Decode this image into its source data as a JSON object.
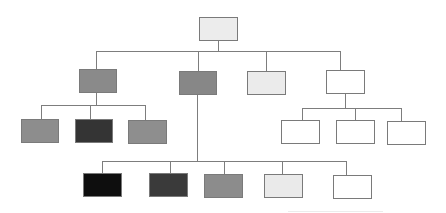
{
  "diagram": {
    "type": "org-chart",
    "title": "",
    "line_color": "#7d7d7d",
    "border_color": "#7a7a7a",
    "nodes": [
      {
        "id": "root",
        "level": 0,
        "fill": "#ececec",
        "x": 199,
        "y": 17,
        "w": 39,
        "h": 24
      },
      {
        "id": "l1-a",
        "level": 1,
        "parent": "root",
        "fill": "#8a8a8a",
        "x": 79,
        "y": 69,
        "w": 38,
        "h": 24
      },
      {
        "id": "l1-b",
        "level": 1,
        "parent": "root",
        "fill": "#878787",
        "x": 179,
        "y": 71,
        "w": 38,
        "h": 24
      },
      {
        "id": "l1-c",
        "level": 1,
        "parent": "root",
        "fill": "#ebebeb",
        "x": 247,
        "y": 71,
        "w": 39,
        "h": 24
      },
      {
        "id": "l1-d",
        "level": 1,
        "parent": "root",
        "fill": "#ffffff",
        "x": 326,
        "y": 70,
        "w": 39,
        "h": 24
      },
      {
        "id": "l2-a1",
        "level": 2,
        "parent": "l1-a",
        "fill": "#8d8d8d",
        "x": 21,
        "y": 119,
        "w": 38,
        "h": 24
      },
      {
        "id": "l2-a2",
        "level": 2,
        "parent": "l1-a",
        "fill": "#343434",
        "x": 75,
        "y": 119,
        "w": 38,
        "h": 24
      },
      {
        "id": "l2-a3",
        "level": 2,
        "parent": "l1-a",
        "fill": "#8e8e8e",
        "x": 128,
        "y": 120,
        "w": 39,
        "h": 24
      },
      {
        "id": "l2-d1",
        "level": 2,
        "parent": "l1-d",
        "fill": "#ffffff",
        "x": 281,
        "y": 120,
        "w": 39,
        "h": 24
      },
      {
        "id": "l2-d2",
        "level": 2,
        "parent": "l1-d",
        "fill": "#ffffff",
        "x": 336,
        "y": 120,
        "w": 39,
        "h": 24
      },
      {
        "id": "l2-d3",
        "level": 2,
        "parent": "l1-d",
        "fill": "#ffffff",
        "x": 387,
        "y": 121,
        "w": 39,
        "h": 24
      },
      {
        "id": "l3-b1",
        "level": 3,
        "parent": "l1-b",
        "fill": "#0e0e0e",
        "x": 83,
        "y": 173,
        "w": 39,
        "h": 24
      },
      {
        "id": "l3-b2",
        "level": 3,
        "parent": "l1-b",
        "fill": "#3a3a3a",
        "x": 149,
        "y": 173,
        "w": 39,
        "h": 24
      },
      {
        "id": "l3-b3",
        "level": 3,
        "parent": "l1-b",
        "fill": "#8c8c8c",
        "x": 204,
        "y": 174,
        "w": 39,
        "h": 24
      },
      {
        "id": "l3-b4",
        "level": 3,
        "parent": "l1-b",
        "fill": "#eaeaea",
        "x": 264,
        "y": 174,
        "w": 39,
        "h": 24
      },
      {
        "id": "l3-b5",
        "level": 3,
        "parent": "l1-b",
        "fill": "#ffffff",
        "x": 333,
        "y": 175,
        "w": 39,
        "h": 24
      }
    ],
    "hlines": [
      {
        "id": "bus-root",
        "x": 96,
        "y": 51,
        "w": 245
      },
      {
        "id": "bus-l1-a",
        "x": 41,
        "y": 105,
        "w": 105
      },
      {
        "id": "bus-l1-d",
        "x": 302,
        "y": 108,
        "w": 100
      },
      {
        "id": "bus-l1-b",
        "x": 102,
        "y": 161,
        "w": 245
      },
      {
        "id": "faint-baseline",
        "x": 288,
        "y": 211,
        "w": 95,
        "faint": true
      }
    ],
    "vlines": [
      {
        "id": "root-down",
        "x": 218,
        "y": 41,
        "h": 10
      },
      {
        "id": "to-l1-a",
        "x": 96,
        "y": 51,
        "h": 18
      },
      {
        "id": "to-l1-b",
        "x": 198,
        "y": 51,
        "h": 20
      },
      {
        "id": "to-l1-c",
        "x": 266,
        "y": 51,
        "h": 20
      },
      {
        "id": "to-l1-d",
        "x": 340,
        "y": 51,
        "h": 19
      },
      {
        "id": "l1-a-down",
        "x": 96,
        "y": 93,
        "h": 12
      },
      {
        "id": "to-l2-a1",
        "x": 41,
        "y": 105,
        "h": 14
      },
      {
        "id": "to-l2-a2",
        "x": 90,
        "y": 105,
        "h": 14
      },
      {
        "id": "to-l2-a3",
        "x": 145,
        "y": 105,
        "h": 15
      },
      {
        "id": "l1-d-down",
        "x": 345,
        "y": 94,
        "h": 14
      },
      {
        "id": "to-l2-d1",
        "x": 302,
        "y": 108,
        "h": 12
      },
      {
        "id": "to-l2-d2",
        "x": 355,
        "y": 108,
        "h": 12
      },
      {
        "id": "to-l2-d3",
        "x": 401,
        "y": 108,
        "h": 13
      },
      {
        "id": "l1-b-down",
        "x": 197,
        "y": 95,
        "h": 66
      },
      {
        "id": "to-l3-b1",
        "x": 102,
        "y": 161,
        "h": 12
      },
      {
        "id": "to-l3-b2",
        "x": 170,
        "y": 161,
        "h": 12
      },
      {
        "id": "to-l3-b3",
        "x": 224,
        "y": 161,
        "h": 13
      },
      {
        "id": "to-l3-b4",
        "x": 282,
        "y": 161,
        "h": 13
      },
      {
        "id": "to-l3-b5",
        "x": 346,
        "y": 161,
        "h": 14
      }
    ]
  }
}
